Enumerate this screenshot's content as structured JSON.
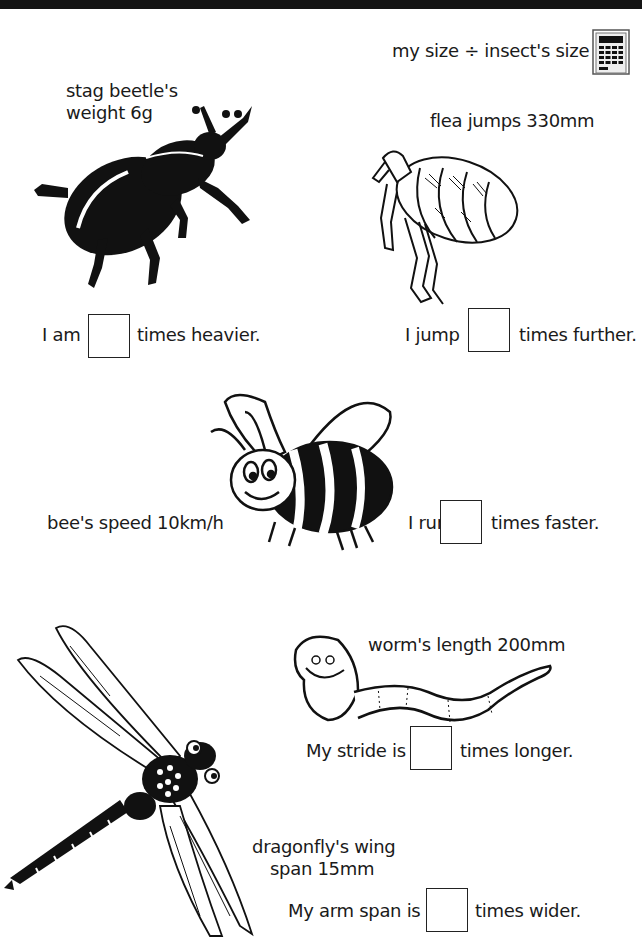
{
  "header": {
    "hint": "my size ÷ insect's size",
    "hint_icon": "calculator-icon"
  },
  "questions": [
    {
      "insect": "stag beetle",
      "fact_line1": "stag beetle's",
      "fact_line2": "weight 6g",
      "prefix": "I am",
      "suffix": "times heavier.",
      "answer": ""
    },
    {
      "insect": "flea",
      "fact_line1": "flea jumps 330mm",
      "prefix": "I jump",
      "suffix": "times further.",
      "answer": ""
    },
    {
      "insect": "bee",
      "fact_line1": "bee's speed 10km/h",
      "prefix": "I run",
      "suffix": "times faster.",
      "answer": ""
    },
    {
      "insect": "worm",
      "fact_line1": "worm's length 200mm",
      "prefix": "My stride is",
      "suffix": "times longer.",
      "answer": ""
    },
    {
      "insect": "dragonfly",
      "fact_line1": "dragonfly's wing",
      "fact_line2": "span 15mm",
      "prefix": "My arm span is",
      "suffix": "times wider.",
      "answer": ""
    }
  ],
  "colors": {
    "ink": "#1a1a1a",
    "topbar": "#141414",
    "paper": "#ffffff"
  }
}
